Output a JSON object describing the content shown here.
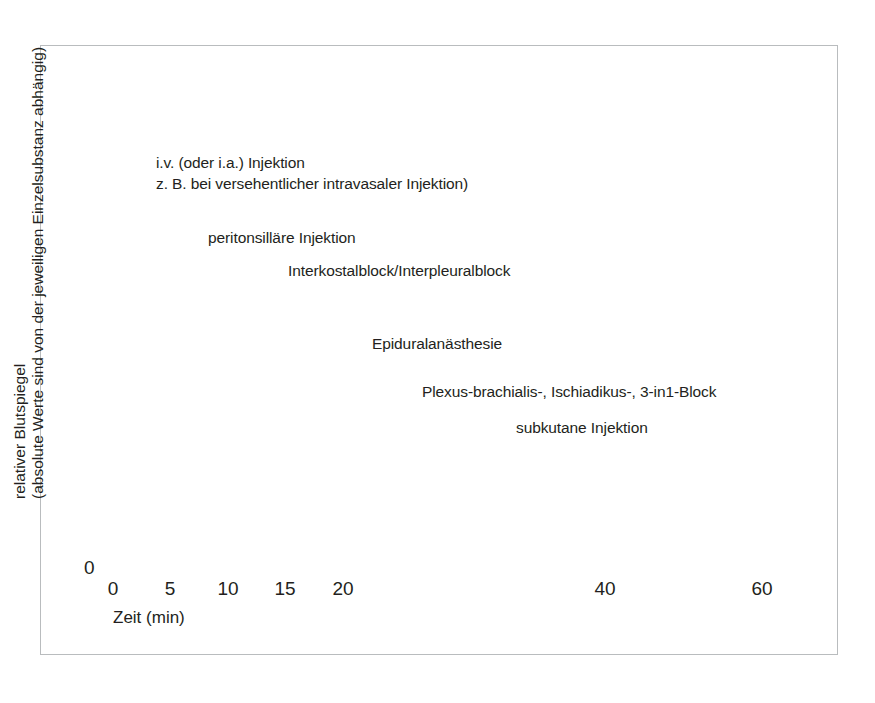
{
  "figure": {
    "background_color": "#ffffff",
    "border_color": "#b9bcbe",
    "plot_fill_color": "#eef1f3"
  },
  "axes": {
    "y_title_line1": "relativer Blutspiegel",
    "y_title_line2": "(absolute Werte sind von der jeweiligen Einzelsubstanz abhängig)",
    "y_zero_label": "0",
    "x_title": "Zeit (min)",
    "x_tick_labels": [
      "0",
      "5",
      "10",
      "15",
      "20",
      "40",
      "60"
    ]
  },
  "annotations": {
    "iv_line1": "i.v. (oder i.a.) Injektion",
    "iv_line2": "z. B. bei versehentlicher intravasaler Injektion)",
    "peritonsillar": "peritonsilläre Injektion",
    "interkostal": "Interkostalblock/Interpleuralblock",
    "epidural": "Epiduralanästhesie",
    "plexus": "Plexus-brachialis-, Ischiadikus-, 3-in1-Block",
    "subkutan": "subkutane Injektion"
  },
  "chart_data": {
    "type": "line",
    "title": "",
    "xlabel": "Zeit (min)",
    "ylabel": "relativer Blutspiegel (absolute Werte sind von der jeweiligen Einzelsubstanz abhängig)",
    "xlim": [
      0,
      65
    ],
    "ylim": [
      0,
      100
    ],
    "grid": false,
    "legend_position": "inline-annotations",
    "x_ticks": [
      0,
      5,
      10,
      15,
      20,
      40,
      60
    ],
    "x_axis_note": "axis is compressed after 20 min; 20-40 and 40-60 spans are drawn at roughly half the scale of 0-20",
    "series": [
      {
        "name": "i.v. (oder i.a.) Injektion — Anstieg",
        "color": "#e8622a",
        "marker_point": {
          "x": 1.1,
          "y": 68
        },
        "x": [
          0.3,
          0.6,
          0.9,
          1.2,
          1.6,
          2.2,
          3.0,
          4.0,
          5.5,
          7.5,
          10,
          13,
          17,
          22,
          30,
          40,
          50,
          60,
          64
        ],
        "y": [
          3,
          40,
          96,
          100,
          97,
          84,
          66,
          52,
          40,
          30,
          23,
          18,
          14,
          12,
          10,
          8.5,
          7.5,
          6.5,
          6
        ]
      },
      {
        "name": "i.v. (oder i.a.) Injektion — Abfall",
        "color": "#e8622a",
        "marker_point": {
          "x": 3.2,
          "y": 46
        },
        "x": [
          1.6,
          1.9,
          2.2,
          2.6,
          3.2,
          4.0,
          5.0,
          6.5,
          8.5,
          11,
          14,
          18,
          24,
          32,
          42,
          52,
          62,
          64
        ],
        "y": [
          100,
          96,
          88,
          74,
          56,
          44,
          36,
          28,
          22,
          17,
          14,
          12,
          10,
          9,
          8,
          7,
          6.5,
          6
        ]
      },
      {
        "name": "peritonsilläre Injektion",
        "color": "#efb04a",
        "marker_point": {
          "x": 6.6,
          "y": 52
        },
        "x": [
          1.7,
          2.5,
          3.5,
          4.5,
          5.5,
          6.6,
          8,
          10,
          12,
          15,
          18,
          22,
          27,
          33,
          40,
          48,
          56,
          62,
          64
        ],
        "y": [
          2,
          14,
          28,
          40,
          48,
          52,
          50,
          45,
          41,
          35,
          31,
          27,
          23,
          20,
          17,
          14,
          11.5,
          10,
          9.5
        ]
      },
      {
        "name": "Interkostalblock/Interpleuralblock",
        "color": "#b49a86",
        "marker_point": {
          "x": 10.9,
          "y": 45
        },
        "x": [
          2.0,
          3.0,
          4.5,
          6.0,
          7.5,
          9.0,
          10.9,
          13,
          16,
          19,
          23,
          28,
          34,
          41,
          48,
          55,
          61,
          64
        ],
        "y": [
          2,
          10,
          24,
          36,
          44,
          47,
          45,
          43,
          39,
          36,
          32,
          28,
          25,
          22,
          19,
          15,
          12.5,
          12
        ]
      },
      {
        "name": "Epiduralanästhesie",
        "color": "#8d2a57",
        "marker_point": {
          "x": 14.6,
          "y": 30
        },
        "x": [
          1.8,
          3.0,
          4.5,
          6.0,
          7.5,
          9.0,
          11,
          13,
          14.6,
          16.5,
          19,
          22,
          26,
          31,
          37,
          44,
          52,
          58,
          62,
          64
        ],
        "y": [
          3,
          7,
          11,
          14,
          17,
          21,
          26,
          29,
          30,
          30,
          28,
          26,
          23,
          20,
          16,
          13,
          11,
          9.5,
          9,
          9
        ]
      },
      {
        "name": "Plexus-brachialis-, Ischiadikus-, 3-in1-Block",
        "color": "#9cbadd",
        "marker_point": {
          "x": 19.6,
          "y": 18
        },
        "x": [
          1.8,
          3.5,
          5.5,
          8,
          10.5,
          13,
          15.5,
          17.5,
          19.6,
          22,
          25,
          29,
          34,
          40,
          47,
          54,
          60,
          64
        ],
        "y": [
          1.5,
          3.5,
          6,
          9,
          12,
          14.5,
          16.5,
          17.5,
          18,
          18,
          17.5,
          16.5,
          15,
          13,
          11,
          9.5,
          8.5,
          7.5
        ]
      },
      {
        "name": "subkutane Injektion",
        "color": "#5a5e62",
        "marker_point": {
          "x": 27.5,
          "y": 13
        },
        "x": [
          2.0,
          4,
          7,
          10,
          13,
          16,
          19,
          22,
          25,
          27.5,
          30,
          33,
          36,
          39,
          42,
          45,
          48,
          52,
          57,
          61,
          64
        ],
        "y": [
          1,
          2.5,
          4.5,
          6.5,
          8,
          9.5,
          11,
          12,
          12.8,
          13,
          13,
          12.5,
          12,
          12.5,
          14,
          15,
          14,
          12,
          10,
          8,
          7
        ]
      }
    ],
    "markers": [
      {
        "label": "i.v. (oder i.a.) Injektion",
        "x_px": 130,
        "y_px": 233
      },
      {
        "label": "i.v. (oder i.a.) Injektion",
        "x_px": 172,
        "y_px": 290
      },
      {
        "label": "peritonsilläre Injektion",
        "x_px": 223,
        "y_px": 339
      },
      {
        "label": "Interkostalblock/Interpleuralblock",
        "x_px": 294,
        "y_px": 365
      },
      {
        "label": "Epiduralanästhesie",
        "x_px": 355,
        "y_px": 445
      },
      {
        "label": "Plexus-brachialis-, Ischiadikus-, 3-in1-Block",
        "x_px": 440,
        "y_px": 489
      },
      {
        "label": "subkutane Injektion",
        "x_px": 528,
        "y_px": 508
      }
    ],
    "arrows": [
      {
        "direction": "up",
        "color": "#e8622a",
        "x_px": 136,
        "note": "steiler Anstieg"
      },
      {
        "direction": "down",
        "color": "#e8622a",
        "x_px": 155,
        "note": "steiler Abfall"
      }
    ]
  }
}
